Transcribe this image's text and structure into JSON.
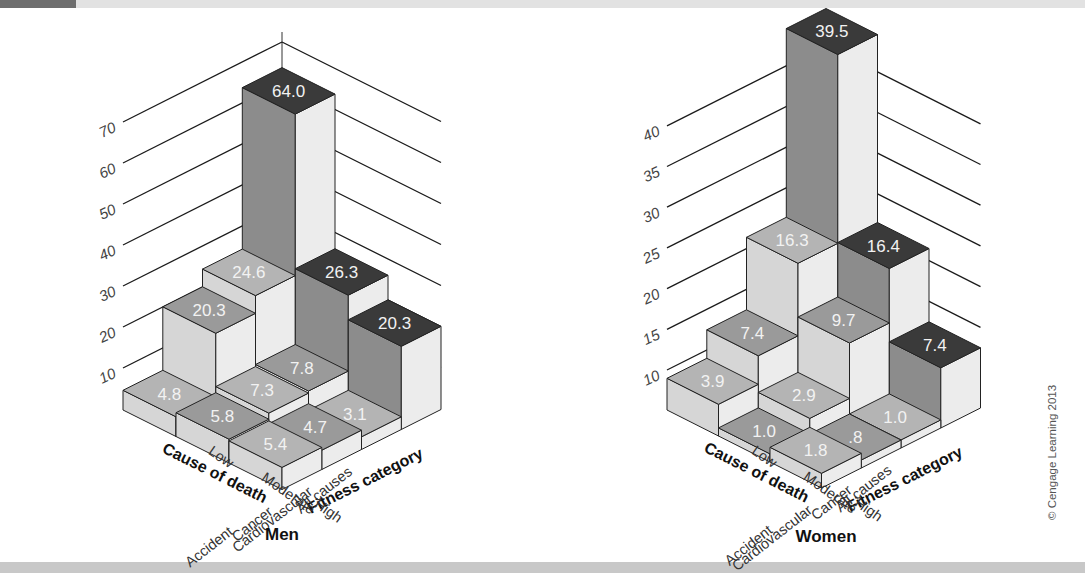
{
  "chart_data": [
    {
      "type": "bar3d",
      "title": "Men",
      "xlabel": "Cause of death",
      "ylabel": "Fitness category",
      "zlabel": "",
      "z_ticks": [
        10,
        20,
        30,
        40,
        50,
        60,
        70
      ],
      "z_unit_px": 4.1,
      "causes": [
        "All causes",
        "Cardiovascular",
        "Cancer",
        "Accident"
      ],
      "fitness": [
        "Low",
        "Moderate",
        "High"
      ],
      "values": [
        [
          64.0,
          26.3,
          20.3
        ],
        [
          24.6,
          7.8,
          3.1
        ],
        [
          20.3,
          7.3,
          4.7
        ],
        [
          4.8,
          5.8,
          5.4
        ]
      ],
      "value_labels": [
        [
          "64.0",
          "26.3",
          "20.3"
        ],
        [
          "24.6",
          "7.8",
          "3.1"
        ],
        [
          "20.3",
          "7.3",
          "4.7"
        ],
        [
          "4.8",
          "5.8",
          "5.4"
        ]
      ]
    },
    {
      "type": "bar3d",
      "title": "Women",
      "xlabel": "Cause of death",
      "ylabel": "Fitness category",
      "zlabel": "",
      "z_ticks": [
        10,
        15,
        20,
        25,
        30,
        35,
        40
      ],
      "z_unit_px": 8.14,
      "causes": [
        "All causes",
        "Cancer",
        "Cardiovascular",
        "Accident"
      ],
      "fitness": [
        "Low",
        "Moderate",
        "High"
      ],
      "values": [
        [
          39.5,
          16.4,
          7.4
        ],
        [
          16.3,
          9.7,
          1.0
        ],
        [
          7.4,
          2.9,
          0.8
        ],
        [
          3.9,
          1.0,
          1.8
        ]
      ],
      "value_labels": [
        [
          "39.5",
          "16.4",
          "7.4"
        ],
        [
          "16.3",
          "9.7",
          "1.0"
        ],
        [
          "7.4",
          "2.9",
          ".8"
        ],
        [
          "3.9",
          "1.0",
          "1.8"
        ]
      ]
    }
  ],
  "charts": [
    {
      "origin": [
        282,
        330
      ],
      "row_vec": [
        -39.75,
        20
      ],
      "col_vec": [
        53,
        26.5
      ],
      "tick_base_y": 368,
      "tick_step_px": 41,
      "wall_top_y": 32,
      "label_pos": [
        282,
        540
      ]
    },
    {
      "origin": [
        826,
        330
      ],
      "row_vec": [
        -39.75,
        20
      ],
      "col_vec": [
        51.5,
        26
      ],
      "tick_base_y": 370,
      "tick_step_px": 40.7,
      "wall_top_y": 34,
      "label_pos": [
        826,
        542
      ]
    }
  ],
  "colors": {
    "all_causes_top": "#3a3a3a",
    "top_mid": "#9a9a9a",
    "top_light": "#b4b4b4",
    "side_left": "#8c8c8c",
    "side_right": "#d6d6d6",
    "side_right_light": "#ececec",
    "edge": "#222222",
    "value_text": "#f2f2f2"
  },
  "copyright": "© Cengage Learning 2013"
}
